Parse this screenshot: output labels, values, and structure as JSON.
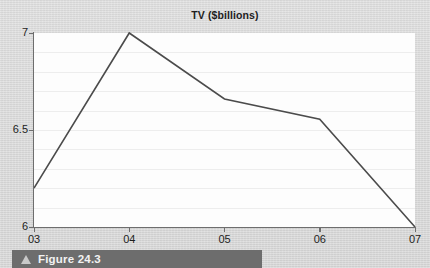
{
  "page": {
    "background_color": "#d8d8d8"
  },
  "caption": {
    "icon": "triangle-up-icon",
    "label": "Figure 24.3",
    "bar_color": "#6d6d6d",
    "text_color": "#f2f2f2"
  },
  "chart_data": {
    "type": "line",
    "title": "TV ($billions)",
    "xlabel": "",
    "ylabel": "",
    "categories": [
      "03",
      "04",
      "05",
      "06",
      "07"
    ],
    "x": [
      "03",
      "04",
      "05",
      "06",
      "07"
    ],
    "values": [
      6.2,
      7.0,
      6.66,
      6.555,
      6.0
    ],
    "series": [
      {
        "name": "TV ($billions)",
        "values": [
          6.2,
          7.0,
          6.66,
          6.555,
          6.0
        ]
      }
    ],
    "ylim": [
      6,
      7
    ],
    "xlim": [
      "03",
      "07"
    ],
    "y_ticks": [
      "6",
      "6.5",
      "7"
    ],
    "y_tick_values": [
      6,
      6.5,
      7
    ],
    "x_ticks": [
      "03",
      "04",
      "05",
      "06",
      "07"
    ],
    "gridlines": {
      "horizontal": true,
      "vertical": false,
      "horizontal_count": 10,
      "color": "#ededed"
    },
    "legend": null,
    "legend_position": "none",
    "line_color": "#4b4b4b",
    "plot_background": "#fdfdfd",
    "axis_color": "#6e6e6e",
    "markers": false
  }
}
